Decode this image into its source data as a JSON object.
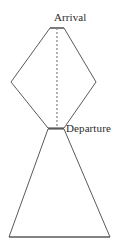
{
  "figure": {
    "title_visible": false,
    "background_color": "#ffffff",
    "stroke_color": "#5a5a5a",
    "stroke_width": 1,
    "dashed_stroke_color": "#8a8a8a",
    "dash_pattern": "2,2",
    "width": 124,
    "height": 250,
    "labels": {
      "arrival": "Arrival",
      "departure": "Departure"
    },
    "shapes": [
      {
        "name": "upper-kite",
        "type": "polygon",
        "description": "Upper kite/diamond shape narrowing to a flat apex at top and a narrow waist at bottom",
        "points": "50,28 64,28 96,82 64,128 48,128 11,82"
      },
      {
        "name": "lower-triangle",
        "type": "polygon",
        "description": "Lower flaring triangle from the narrow waist down to a wide base",
        "points": "48,129 64,129 110,237 9,237"
      }
    ],
    "segments": [
      {
        "name": "apex-flat-top",
        "type": "line",
        "x1": 50,
        "y1": 28,
        "x2": 64,
        "y2": 28
      },
      {
        "name": "waist-line",
        "type": "line",
        "x1": 48,
        "y1": 128,
        "x2": 64,
        "y2": 128
      },
      {
        "name": "base-line",
        "type": "line",
        "x1": 9,
        "y1": 237,
        "x2": 110,
        "y2": 237
      },
      {
        "name": "center-axis-dashed",
        "type": "dashed-line",
        "x1": 57,
        "y1": 28,
        "x2": 57,
        "y2": 128
      }
    ]
  }
}
